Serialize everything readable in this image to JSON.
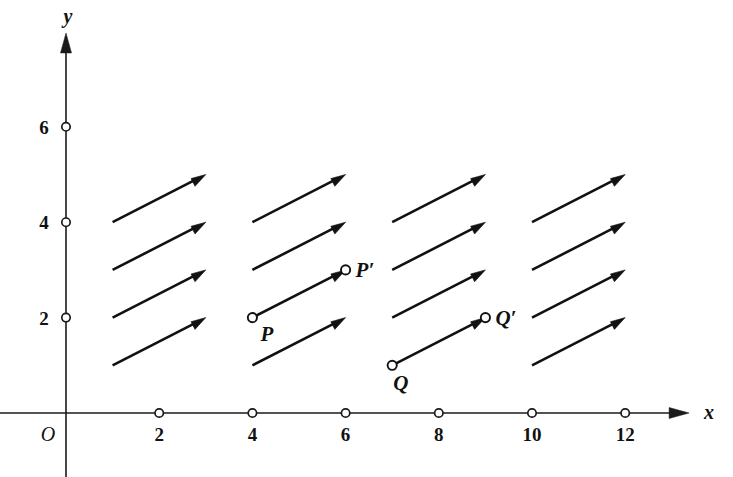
{
  "figure": {
    "background_color": "#ffffff",
    "ink_color": "#111111"
  },
  "chart_data": {
    "type": "scatter",
    "title": "",
    "xlabel": "x",
    "ylabel": "y",
    "xlim": [
      0,
      13.2
    ],
    "ylim": [
      0,
      7.8
    ],
    "grid": false,
    "legend": null,
    "x_ticks": [
      2,
      4,
      6,
      8,
      10,
      12
    ],
    "x_tick_labels": [
      "2",
      "4",
      "6",
      "8",
      "10",
      "12"
    ],
    "y_ticks": [
      2,
      4,
      6
    ],
    "y_tick_labels": [
      "2",
      "4",
      "6"
    ],
    "origin_label": "O",
    "vector_components": [
      2,
      1
    ],
    "vector_columns_tail_x": [
      1,
      4,
      7,
      10
    ],
    "vector_rows_tail_y": [
      1,
      2,
      3,
      4
    ],
    "vectors": [
      {
        "tail": [
          1,
          1
        ],
        "head": [
          3,
          2
        ]
      },
      {
        "tail": [
          1,
          2
        ],
        "head": [
          3,
          3
        ]
      },
      {
        "tail": [
          1,
          3
        ],
        "head": [
          3,
          4
        ]
      },
      {
        "tail": [
          1,
          4
        ],
        "head": [
          3,
          5
        ]
      },
      {
        "tail": [
          4,
          1
        ],
        "head": [
          6,
          2
        ]
      },
      {
        "tail": [
          4,
          2
        ],
        "head": [
          6,
          3
        ]
      },
      {
        "tail": [
          4,
          3
        ],
        "head": [
          6,
          4
        ]
      },
      {
        "tail": [
          4,
          4
        ],
        "head": [
          6,
          5
        ]
      },
      {
        "tail": [
          7,
          1
        ],
        "head": [
          9,
          2
        ]
      },
      {
        "tail": [
          7,
          2
        ],
        "head": [
          9,
          3
        ]
      },
      {
        "tail": [
          7,
          3
        ],
        "head": [
          9,
          4
        ]
      },
      {
        "tail": [
          7,
          4
        ],
        "head": [
          9,
          5
        ]
      },
      {
        "tail": [
          10,
          1
        ],
        "head": [
          12,
          2
        ]
      },
      {
        "tail": [
          10,
          2
        ],
        "head": [
          12,
          3
        ]
      },
      {
        "tail": [
          10,
          3
        ],
        "head": [
          12,
          4
        ]
      },
      {
        "tail": [
          10,
          4
        ],
        "head": [
          12,
          5
        ]
      }
    ],
    "labeled_points": [
      {
        "name": "P",
        "label": "P",
        "x": 4,
        "y": 2,
        "label_dx": 8,
        "label_dy": 23
      },
      {
        "name": "Pp",
        "label": "P′",
        "x": 6,
        "y": 3,
        "label_dx": 10,
        "label_dy": 7
      },
      {
        "name": "Q",
        "label": "Q",
        "x": 7,
        "y": 1,
        "label_dx": 1,
        "label_dy": 25
      },
      {
        "name": "Qp",
        "label": "Q′",
        "x": 9,
        "y": 2,
        "label_dx": 10,
        "label_dy": 7
      }
    ]
  },
  "axes": {
    "x_axis_name": "x",
    "y_axis_name": "y",
    "origin_label": "O"
  }
}
